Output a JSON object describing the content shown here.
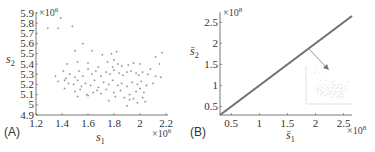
{
  "chart_data": [
    {
      "type": "scatter",
      "panel_label": "(A)",
      "xlabel": "s1",
      "ylabel": "s2",
      "x_multiplier": "×10^6",
      "y_multiplier": "×10^6",
      "xlim": [
        1.2,
        2.2
      ],
      "ylim": [
        4.9,
        5.9
      ],
      "xticks": [
        "1.2",
        "1.4",
        "1.6",
        "1.8",
        "2",
        "2.2"
      ],
      "yticks": [
        "4.9",
        "5",
        "5.1",
        "5.2",
        "5.3",
        "5.4",
        "5.5",
        "5.6",
        "5.7",
        "5.8",
        "5.9"
      ],
      "grid": false,
      "marker_color": "#888888",
      "points": [
        [
          1.29,
          5.75
        ],
        [
          1.37,
          5.75
        ],
        [
          1.48,
          5.77
        ],
        [
          1.39,
          5.85
        ],
        [
          1.56,
          5.6
        ],
        [
          1.5,
          5.53
        ],
        [
          1.63,
          5.53
        ],
        [
          1.71,
          5.49
        ],
        [
          1.78,
          5.5
        ],
        [
          1.82,
          5.52
        ],
        [
          2.17,
          5.51
        ],
        [
          2.12,
          5.47
        ],
        [
          1.44,
          5.4
        ],
        [
          1.52,
          5.42
        ],
        [
          1.6,
          5.41
        ],
        [
          1.68,
          5.37
        ],
        [
          1.75,
          5.42
        ],
        [
          1.8,
          5.44
        ],
        [
          1.83,
          5.4
        ],
        [
          1.79,
          5.37
        ],
        [
          1.86,
          5.38
        ],
        [
          1.91,
          5.39
        ],
        [
          1.95,
          5.41
        ],
        [
          2.0,
          5.4
        ],
        [
          2.08,
          5.35
        ],
        [
          2.15,
          5.4
        ],
        [
          1.35,
          5.28
        ],
        [
          1.41,
          5.33
        ],
        [
          1.43,
          5.26
        ],
        [
          1.46,
          5.3
        ],
        [
          1.5,
          5.27
        ],
        [
          1.53,
          5.33
        ],
        [
          1.56,
          5.28
        ],
        [
          1.6,
          5.35
        ],
        [
          1.63,
          5.3
        ],
        [
          1.66,
          5.33
        ],
        [
          1.7,
          5.28
        ],
        [
          1.74,
          5.32
        ],
        [
          1.77,
          5.3
        ],
        [
          1.8,
          5.34
        ],
        [
          1.84,
          5.31
        ],
        [
          1.87,
          5.29
        ],
        [
          1.9,
          5.32
        ],
        [
          1.93,
          5.33
        ],
        [
          1.97,
          5.31
        ],
        [
          1.99,
          5.29
        ],
        [
          2.02,
          5.32
        ],
        [
          2.06,
          5.3
        ],
        [
          2.12,
          5.28
        ],
        [
          2.16,
          5.27
        ],
        [
          1.37,
          5.23
        ],
        [
          1.42,
          5.24
        ],
        [
          1.45,
          5.21
        ],
        [
          1.49,
          5.2
        ],
        [
          1.52,
          5.24
        ],
        [
          1.55,
          5.18
        ],
        [
          1.58,
          5.21
        ],
        [
          1.62,
          5.19
        ],
        [
          1.65,
          5.24
        ],
        [
          1.68,
          5.17
        ],
        [
          1.72,
          5.22
        ],
        [
          1.76,
          5.2
        ],
        [
          1.79,
          5.24
        ],
        [
          1.83,
          5.19
        ],
        [
          1.86,
          5.21
        ],
        [
          1.9,
          5.18
        ],
        [
          1.94,
          5.22
        ],
        [
          1.98,
          5.2
        ],
        [
          2.01,
          5.23
        ],
        [
          2.05,
          5.19
        ],
        [
          2.1,
          5.21
        ],
        [
          1.42,
          5.16
        ],
        [
          1.5,
          5.13
        ],
        [
          1.54,
          5.15
        ],
        [
          1.59,
          5.1
        ],
        [
          1.64,
          5.12
        ],
        [
          1.67,
          5.14
        ],
        [
          1.7,
          5.11
        ],
        [
          1.74,
          5.15
        ],
        [
          1.8,
          5.12
        ],
        [
          1.85,
          5.14
        ],
        [
          1.92,
          5.1
        ],
        [
          1.97,
          5.13
        ],
        [
          2.0,
          5.16
        ],
        [
          2.03,
          5.12
        ],
        [
          1.52,
          5.08
        ],
        [
          1.6,
          5.09
        ],
        [
          1.76,
          5.04
        ],
        [
          1.81,
          5.08
        ],
        [
          1.88,
          5.07
        ],
        [
          1.92,
          5.05
        ],
        [
          1.95,
          5.06
        ],
        [
          2.02,
          5.07
        ],
        [
          2.04,
          5.03
        ],
        [
          1.9,
          4.99
        ],
        [
          1.98,
          5.02
        ]
      ]
    },
    {
      "type": "line",
      "panel_label": "(B)",
      "xlabel": "s̄1",
      "ylabel": "s̄2",
      "x_multiplier": "×10^8",
      "y_multiplier": "×10^8",
      "xlim": [
        0.3,
        2.65
      ],
      "ylim": [
        0.3,
        2.65
      ],
      "xticks": [
        "0.5",
        "1",
        "1.5",
        "2",
        "2.5"
      ],
      "yticks": [
        "0.5",
        "1",
        "1.5",
        "2",
        "2.5"
      ],
      "grid": false,
      "line_color": "#707070",
      "series": [
        {
          "name": "s̄2 vs s̄1",
          "x": [
            0.3,
            2.65
          ],
          "y": [
            0.3,
            2.65
          ]
        }
      ],
      "annotation": "arrow from line near (1.9, 1.9) to inset showing magnified scatter of points"
    }
  ],
  "labels": {
    "panel_a": "(A)",
    "panel_b": "(B)",
    "a_ylabel": "s",
    "a_ylabel_sub": "2",
    "a_xlabel": "s",
    "a_xlabel_sub": "1",
    "a_ymult": "×10",
    "a_ymult_exp": "6",
    "a_xmult": "×10",
    "a_xmult_exp": "6",
    "b_ylabel": "s̄",
    "b_ylabel_sub": "2",
    "b_xlabel": "s̄",
    "b_xlabel_sub": "1",
    "b_ymult": "×10",
    "b_ymult_exp": "8",
    "b_xmult": "×10",
    "b_xmult_exp": "8"
  }
}
